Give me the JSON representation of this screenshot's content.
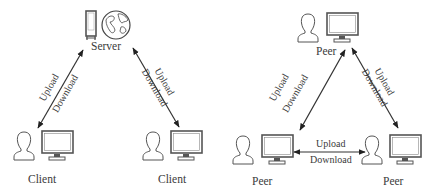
{
  "diagrams": {
    "client_server": {
      "server_label": "Server",
      "client_left_label": "Client",
      "client_right_label": "Client",
      "left_link": {
        "top": "Upload",
        "bottom": "Download"
      },
      "right_link": {
        "top": "Upload",
        "bottom": "Download"
      }
    },
    "peer_to_peer": {
      "peer_top_label": "Peer",
      "peer_left_label": "Peer",
      "peer_right_label": "Peer",
      "left_link": {
        "top": "Upload",
        "bottom": "Download"
      },
      "right_link": {
        "top": "Upload",
        "bottom": "Download"
      },
      "bottom_link": {
        "top": "Upload",
        "bottom": "Download"
      }
    }
  },
  "colors": {
    "stroke": "#444444",
    "text": "#3a3a3a",
    "background": "#ffffff"
  }
}
